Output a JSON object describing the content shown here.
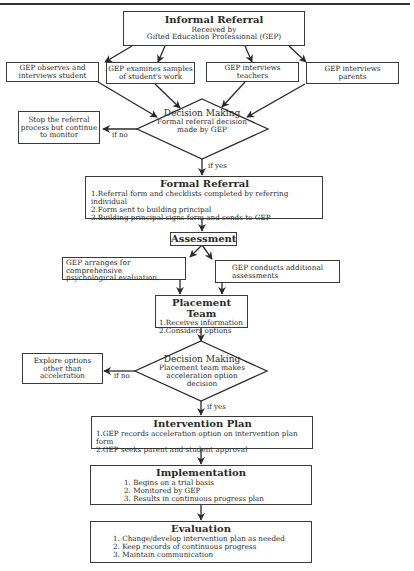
{
  "diagram": {
    "informal_referral": {
      "title": "Informal Referral",
      "line1": "Received by",
      "line2": "Gifted Education Professional (GEP)"
    },
    "gep_activities": [
      {
        "line1": "GEP observes and",
        "line2": "interviews student"
      },
      {
        "line1": "GEP examines samples",
        "line2": "of student's work"
      },
      {
        "line1": "GEP interviews",
        "line2": "teachers"
      },
      {
        "line1": "GEP interviews",
        "line2": "parents"
      }
    ],
    "decision1": {
      "title": "Decision Making",
      "line1": "Formal referral decision",
      "line2": "made by GEP",
      "no_label": "if no",
      "yes_label": "if yes"
    },
    "stop_box": {
      "line1": "Stop the referral",
      "line2": "process but continue",
      "line3": "to monitor"
    },
    "formal_referral": {
      "title": "Formal Referral",
      "items": [
        "1.Referral form and checklists completed by referring individual",
        "2.Form sent to building principal",
        "3.Building principal signs form and sends to GEP"
      ]
    },
    "assessment": {
      "title": "Assessment"
    },
    "assessment_left": {
      "line1": "GEP arranges for comprehensive",
      "line2": "psychological evaluation"
    },
    "assessment_right": {
      "line1": "GEP conducts additional",
      "line2": "assessments"
    },
    "placement_team": {
      "title": "Placement Team",
      "items": [
        "1.Receives information",
        "2.Considers options"
      ]
    },
    "decision2": {
      "title": "Decision Making",
      "line1": "Placement team makes",
      "line2": "acceleration option",
      "line3": "decision",
      "no_label": "if no",
      "yes_label": "if yes"
    },
    "explore_box": {
      "line1": "Explore options",
      "line2": "other than",
      "line3": "acceleration"
    },
    "intervention_plan": {
      "title": "Intervention Plan",
      "items": [
        "1.GEP records acceleration option on intervention plan form",
        "2.GEP seeks parent and student approval"
      ]
    },
    "implementation": {
      "title": "Implementation",
      "items": [
        "1. Begins on a trial basis",
        "2. Monitored by GEP",
        "3. Results in continuous progress plan"
      ]
    },
    "evaluation": {
      "title": "Evaluation",
      "items": [
        "1. Change/develop intervention plan as needed",
        "2. Keep records of continuous progress",
        "3. Maintain communication"
      ]
    }
  }
}
